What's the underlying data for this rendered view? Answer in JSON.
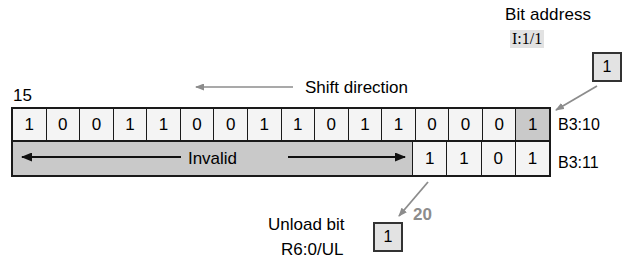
{
  "diagram": {
    "bit_address_label": "Bit address",
    "bit_address_value": "I:1/1",
    "bit_address_box_value": "1",
    "shift_direction_label": "Shift direction",
    "top_index_label": "15",
    "bottom_index_label": "20",
    "unload_label_line1": "Unload bit",
    "unload_label_line2": "R6:0/UL",
    "unload_box_value": "1",
    "invalid_label": "Invalid",
    "rows": [
      {
        "address": "B3:10",
        "bits": [
          "1",
          "0",
          "0",
          "1",
          "1",
          "0",
          "0",
          "1",
          "1",
          "0",
          "1",
          "1",
          "0",
          "0",
          "0",
          "1"
        ],
        "highlight_index": 15
      },
      {
        "address": "B3:11",
        "invalid_cells": 12,
        "bits": [
          "1",
          "1",
          "0",
          "1"
        ]
      }
    ],
    "colors": {
      "grid_border": "#1a1a1a",
      "cell_fill": "#f4f4f4",
      "highlight_fill": "#c9c9c9",
      "invalid_fill": "#c9c9c9",
      "callout_fill": "#e3e3e3",
      "index_accent": "#8c8c8c",
      "arrow_gray": "#8c8c8c"
    }
  }
}
